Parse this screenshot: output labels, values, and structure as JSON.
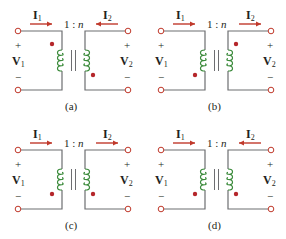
{
  "figure": {
    "colors": {
      "wire": "#6d6e71",
      "coil": "#3a8a3a",
      "dot": "#b5262b",
      "arrow": "#c0392b",
      "text": "#231f20"
    },
    "panels": [
      {
        "id": "a",
        "caption": "(a)",
        "ratio_prefix": "1 : ",
        "ratio_var": "n",
        "i1": {
          "label": "I",
          "sub": "1",
          "direction": "right"
        },
        "i2": {
          "label": "I",
          "sub": "2",
          "direction": "left"
        },
        "v1": {
          "label": "V",
          "sub": "1",
          "plus": "+",
          "minus": "−"
        },
        "v2": {
          "label": "V",
          "sub": "2",
          "plus": "+",
          "minus": "−"
        },
        "dot_primary": "top",
        "dot_secondary": "bottom"
      },
      {
        "id": "b",
        "caption": "(b)",
        "ratio_prefix": "1 : ",
        "ratio_var": "n",
        "i1": {
          "label": "I",
          "sub": "1",
          "direction": "right"
        },
        "i2": {
          "label": "I",
          "sub": "2",
          "direction": "right"
        },
        "v1": {
          "label": "V",
          "sub": "1",
          "plus": "+",
          "minus": "−"
        },
        "v2": {
          "label": "V",
          "sub": "2",
          "plus": "+",
          "minus": "−"
        },
        "dot_primary": "bottom",
        "dot_secondary": "top"
      },
      {
        "id": "c",
        "caption": "(c)",
        "ratio_prefix": "1 : ",
        "ratio_var": "n",
        "i1": {
          "label": "I",
          "sub": "1",
          "direction": "right"
        },
        "i2": {
          "label": "I",
          "sub": "2",
          "direction": "right"
        },
        "v1": {
          "label": "V",
          "sub": "1",
          "plus": "+",
          "minus": "−"
        },
        "v2": {
          "label": "V",
          "sub": "2",
          "plus": "+",
          "minus": "−"
        },
        "dot_primary": "bottom",
        "dot_secondary": "bottom"
      },
      {
        "id": "d",
        "caption": "(d)",
        "ratio_prefix": "1 : ",
        "ratio_var": "n",
        "i1": {
          "label": "I",
          "sub": "1",
          "direction": "right"
        },
        "i2": {
          "label": "I",
          "sub": "2",
          "direction": "left"
        },
        "v1": {
          "label": "V",
          "sub": "1",
          "plus": "+",
          "minus": "−"
        },
        "v2": {
          "label": "V",
          "sub": "2",
          "plus": "+",
          "minus": "−"
        },
        "dot_primary": "bottom",
        "dot_secondary": "bottom"
      }
    ]
  }
}
